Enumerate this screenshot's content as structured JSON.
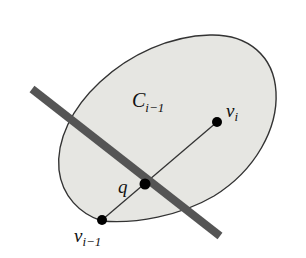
{
  "figure": {
    "region_label": {
      "main": "C",
      "sub": "i−1"
    },
    "points": {
      "v_i": {
        "main": "v",
        "sub": "i",
        "x": 217,
        "y": 122
      },
      "q": {
        "main": "q",
        "x": 145,
        "y": 184
      },
      "v_im1": {
        "main": "v",
        "sub": "i−1",
        "x": 102,
        "y": 220
      }
    },
    "colors": {
      "region_fill": "#e6e6e2",
      "region_stroke": "#333333",
      "bar": "#555555",
      "points": "#000000",
      "segment": "#333333"
    }
  }
}
